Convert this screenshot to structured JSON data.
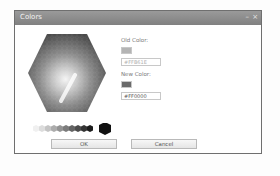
{
  "window": {
    "title": "Colors",
    "minimize_glyph": "–",
    "close_glyph": "×"
  },
  "picker": {
    "type": "hexagon-color-grid",
    "rendering": "grayscale"
  },
  "old_color": {
    "label": "Old Color:",
    "swatch_color": "#b4b4b4",
    "value": "#FFB61E"
  },
  "new_color": {
    "label": "New Color:",
    "swatch_color": "#6a6a6a",
    "value": "#FF0000"
  },
  "grayscale_swatches": [
    "#f0f0f0",
    "#dcdcdc",
    "#c4c4c4",
    "#acacac",
    "#949494",
    "#7c7c7c",
    "#646464",
    "#4c4c4c",
    "#343434",
    "#1c1c1c"
  ],
  "selected_swatch": "#111111",
  "buttons": {
    "ok": "OK",
    "cancel": "Cancel"
  }
}
